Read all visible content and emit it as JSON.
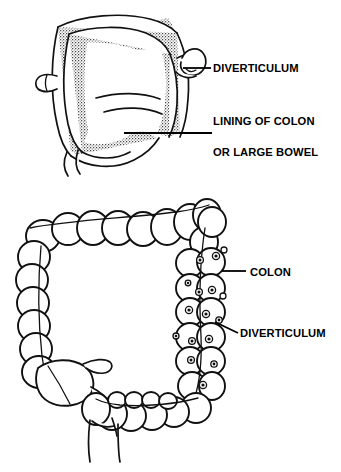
{
  "figure": {
    "background_color": "#ffffff",
    "ink_color": "#111111",
    "width": 341,
    "height": 472
  },
  "panels": [
    {
      "id": "cross-section",
      "name": "Colon wall cross-section with diverticulum",
      "labels": [
        {
          "id": "diverticulum",
          "text": "DIVERTICULUM",
          "x": 213,
          "y": 72
        },
        {
          "id": "lining-of-colon",
          "text": "LINING OF COLON",
          "x": 213,
          "y": 125
        },
        {
          "id": "or-large-bowel",
          "text": "OR LARGE BOWEL",
          "x": 213,
          "y": 156
        }
      ],
      "leaders": [
        {
          "id": "diverticulum-leader",
          "type": "straight",
          "x1": 183,
          "y1": 68,
          "x2": 211,
          "y2": 68
        },
        {
          "id": "lining-underline",
          "type": "underline",
          "x1": 124,
          "y1": 133,
          "x2": 212,
          "y2": 133
        }
      ]
    },
    {
      "id": "whole-colon",
      "name": "Large bowel with multiple diverticula",
      "labels": [
        {
          "id": "colon",
          "text": "COLON",
          "x": 250,
          "y": 276
        },
        {
          "id": "diverticulum",
          "text": "DIVERTICULUM",
          "x": 240,
          "y": 337
        }
      ],
      "leaders": [
        {
          "id": "colon-leader",
          "type": "straight",
          "x1": 222,
          "y1": 271,
          "x2": 246,
          "y2": 271
        },
        {
          "id": "diverticulum-leader",
          "type": "diagonal",
          "x1": 215,
          "y1": 322,
          "x2": 238,
          "y2": 333
        }
      ],
      "regions": [
        "ascending colon",
        "transverse colon",
        "descending colon",
        "sigmoid colon",
        "cecum",
        "appendix",
        "rectum"
      ],
      "diverticula_count": 18
    }
  ]
}
